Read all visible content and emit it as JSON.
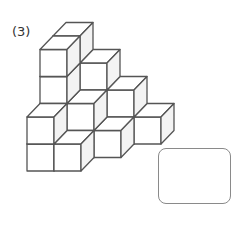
{
  "problem": {
    "label": "(3)"
  },
  "figure": {
    "type": "isometric-cube-stack",
    "cube_count_visible_structure": "staircase",
    "origin": {
      "x": 27,
      "y": 171
    },
    "cube_size": 27,
    "depth_offset": {
      "dx": 13,
      "dy": -13.5
    },
    "stroke_color": "#555555",
    "front_fill": "#ffffff",
    "top_fill": "#ffffff",
    "side_fill": "#f3f3f3",
    "columns": [
      {
        "i": 0,
        "k": 2,
        "height": 4
      },
      {
        "i": 1,
        "k": 2,
        "height": 3
      },
      {
        "i": 2,
        "k": 2,
        "height": 2
      },
      {
        "i": 3,
        "k": 2,
        "height": 1
      },
      {
        "i": 0,
        "k": 1,
        "height": 4
      },
      {
        "i": 1,
        "k": 1,
        "height": 2
      },
      {
        "i": 2,
        "k": 1,
        "height": 1
      },
      {
        "i": 0,
        "k": 0,
        "height": 2
      },
      {
        "i": 1,
        "k": 0,
        "height": 1
      }
    ]
  },
  "answer_box": {
    "value": ""
  }
}
